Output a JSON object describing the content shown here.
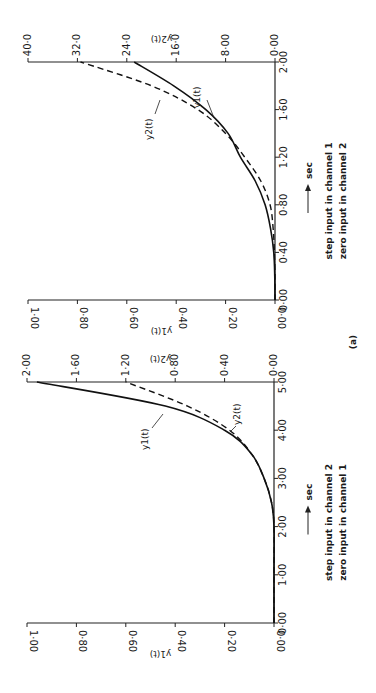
{
  "figure_label": "(a)",
  "chart_data": [
    {
      "type": "line",
      "panel": "top",
      "caption": [
        "step input in channel 1",
        "zero input in channel 2"
      ],
      "xlabel": "sec",
      "x_ticks": [
        "0·00",
        "0·40",
        "0·80",
        "1·20",
        "1·60",
        "2·00"
      ],
      "xlim": [
        0,
        2
      ],
      "y1_label": "y1(t)",
      "y1_ticks": [
        "0·00",
        "0·20",
        "0·40",
        "0·60",
        "0·80",
        "1·00"
      ],
      "y1_lim": [
        0,
        1
      ],
      "y2_label": "y2(t)",
      "y2_ticks": [
        "0·00",
        "8·00",
        "16·0",
        "24·0",
        "32·0",
        "40·0"
      ],
      "y2_lim": [
        0,
        40
      ],
      "series": [
        {
          "name": "y1(t)",
          "axis": "y1",
          "style": "solid",
          "x": [
            0,
            0.2,
            0.4,
            0.6,
            0.8,
            1.0,
            1.2,
            1.4,
            1.6,
            1.8,
            2.0
          ],
          "values": [
            0,
            0.001,
            0.005,
            0.018,
            0.04,
            0.08,
            0.14,
            0.19,
            0.28,
            0.41,
            0.57
          ]
        },
        {
          "name": "y2(t)",
          "axis": "y2",
          "style": "dashed",
          "x": [
            0,
            0.2,
            0.4,
            0.6,
            0.8,
            1.0,
            1.2,
            1.4,
            1.6,
            1.8,
            2.0
          ],
          "values": [
            0,
            0.0,
            0.1,
            0.3,
            0.8,
            2.3,
            4.9,
            8.0,
            12.5,
            20.0,
            31.5
          ]
        }
      ],
      "annotations": [
        "y1(t)",
        "y2(t)"
      ]
    },
    {
      "type": "line",
      "panel": "bottom",
      "caption": [
        "step input in channel 2",
        "zero input in channel 1"
      ],
      "xlabel": "sec",
      "x_ticks": [
        "0·00",
        "1·00",
        "2·00",
        "3·00",
        "4·00",
        "5·00"
      ],
      "xlim": [
        0,
        5
      ],
      "y1_label": "y1(t)",
      "y1_ticks": [
        "0·00",
        "0·20",
        "0·40",
        "0·60",
        "0·80",
        "1·00"
      ],
      "y1_lim": [
        0,
        1
      ],
      "y2_label": "y2(t)",
      "y2_ticks": [
        "0·00",
        "0·40",
        "0·80",
        "1·20",
        "1·60",
        "2·00"
      ],
      "y2_lim": [
        0,
        2
      ],
      "series": [
        {
          "name": "y1(t)",
          "axis": "y1",
          "style": "solid",
          "x": [
            0,
            1.0,
            2.0,
            2.5,
            3.0,
            3.5,
            4.0,
            4.5,
            5.0
          ],
          "values": [
            0,
            0,
            0,
            0.01,
            0.04,
            0.09,
            0.2,
            0.44,
            0.96
          ]
        },
        {
          "name": "y2(t)",
          "axis": "y2",
          "style": "dashed",
          "x": [
            0,
            1.0,
            2.0,
            2.5,
            3.0,
            3.5,
            4.0,
            4.5,
            5.0
          ],
          "values": [
            0,
            0,
            0,
            0.02,
            0.08,
            0.18,
            0.36,
            0.7,
            1.2
          ]
        }
      ],
      "annotations": [
        "y1(t)",
        "y2(t)"
      ]
    }
  ]
}
